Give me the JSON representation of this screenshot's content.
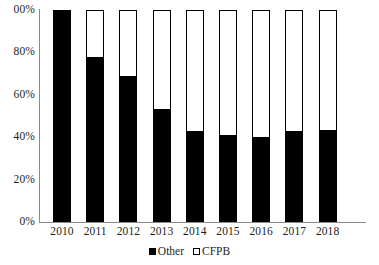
{
  "chart_data": {
    "type": "bar",
    "subtype": "stacked-100-percent",
    "title": "",
    "xlabel": "",
    "ylabel": "",
    "categories": [
      "2010",
      "2011",
      "2012",
      "2013",
      "2014",
      "2015",
      "2016",
      "2017",
      "2018"
    ],
    "series": [
      {
        "name": "Other",
        "color": "#000000",
        "values": [
          100,
          78,
          69,
          53.5,
          43,
          41,
          40,
          43,
          43.5
        ]
      },
      {
        "name": "CFPB",
        "color": "#ffffff",
        "values": [
          0,
          22,
          31,
          46.5,
          57,
          59,
          60,
          57,
          56.5
        ]
      }
    ],
    "ylim": [
      0,
      100
    ],
    "ytick_labels": [
      "00%",
      "80%",
      "60%",
      "40%",
      "20%",
      "0%"
    ],
    "ytick_values": [
      100,
      80,
      60,
      40,
      20,
      0
    ],
    "grid": false,
    "legend_position": "bottom",
    "legend": [
      {
        "label": "Other",
        "marker": "filled-square",
        "color": "#000000"
      },
      {
        "label": "CFPB",
        "marker": "open-square",
        "color": "#ffffff"
      }
    ]
  }
}
